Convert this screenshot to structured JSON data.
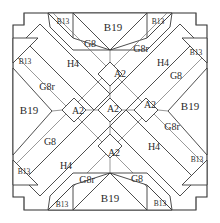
{
  "diagram": {
    "type": "quilt-block-layout",
    "background_color": "#ffffff",
    "line_color": "#3a3a3a",
    "label_color": "#2b2b2b",
    "pieces": {
      "corner_small": "B13",
      "edge_large": "B19",
      "triangle": "G8",
      "triangle_reversed": "G8r",
      "bar": "H4",
      "center_diamond": "A2"
    },
    "labels": {
      "top_left_b13": "B13",
      "top_right_b13": "B13",
      "top_center_b19": "B19",
      "top_left_g8": "G8",
      "top_right_g8r": "G8r",
      "left_upper_b13": "B13",
      "right_upper_b13": "B13",
      "left_h4": "H4",
      "right_h4": "H4",
      "right_upper_g8": "G8",
      "left_g8r": "G8r",
      "left_b19": "B19",
      "right_b19": "B19",
      "a2_top": "A2",
      "a2_left": "A2",
      "a2_center": "A2",
      "a2_right": "A2",
      "a2_bottom": "A2",
      "left_lower_g8": "G8",
      "right_lower_g8r": "G8r",
      "left_lower_b13": "B13",
      "right_lower_b13": "B13",
      "bottom_left_h4": "H4",
      "bottom_right_h4": "H4",
      "bottom_left_g8r": "G8r",
      "bottom_right_g8": "G8",
      "bottom_center_b19": "B19",
      "bottom_left_b13": "B13",
      "bottom_right_b13": "B13"
    }
  }
}
